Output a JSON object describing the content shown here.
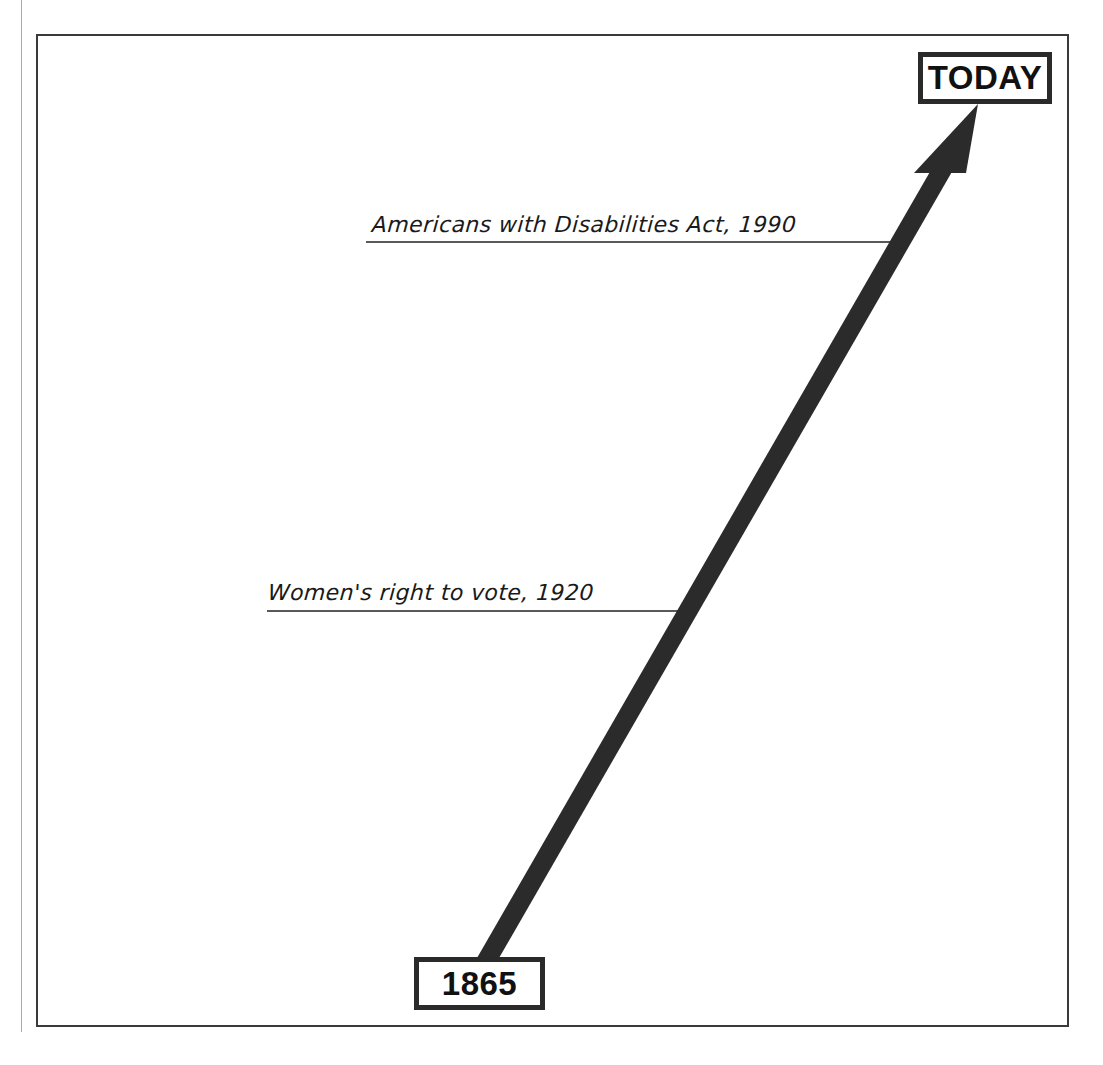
{
  "timeline": {
    "start": {
      "label": "1865"
    },
    "end": {
      "label": "TODAY"
    },
    "events": [
      {
        "label": "Americans with Disabilities Act, 1990",
        "year": 1990
      },
      {
        "label": "Women's right to vote, 1920",
        "year": 1920
      }
    ]
  },
  "colors": {
    "arrow": "#2b2b2b",
    "frame": "#3a3a3a",
    "text": "#111111"
  }
}
